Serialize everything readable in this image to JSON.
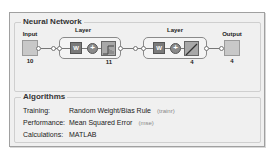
{
  "neural_network": {
    "title": "Neural Network",
    "input": {
      "label": "Input",
      "size": "10"
    },
    "layers": [
      {
        "label": "Layer",
        "weight_label": "W",
        "sum_symbol": "+",
        "transfer": "hardlim-icon",
        "size": "11"
      },
      {
        "label": "Layer",
        "weight_label": "W",
        "sum_symbol": "+",
        "transfer": "purelin-icon",
        "size": "4"
      }
    ],
    "output": {
      "label": "Output",
      "size": "4"
    }
  },
  "algorithms": {
    "title": "Algorithms",
    "rows": [
      {
        "key": "Training:",
        "value": "Random Weight/Bias Rule",
        "fn": "(trainr)"
      },
      {
        "key": "Performance:",
        "value": "Mean Squared Error",
        "fn": "(mse)"
      },
      {
        "key": "Calculations:",
        "value": "MATLAB",
        "fn": ""
      }
    ]
  }
}
